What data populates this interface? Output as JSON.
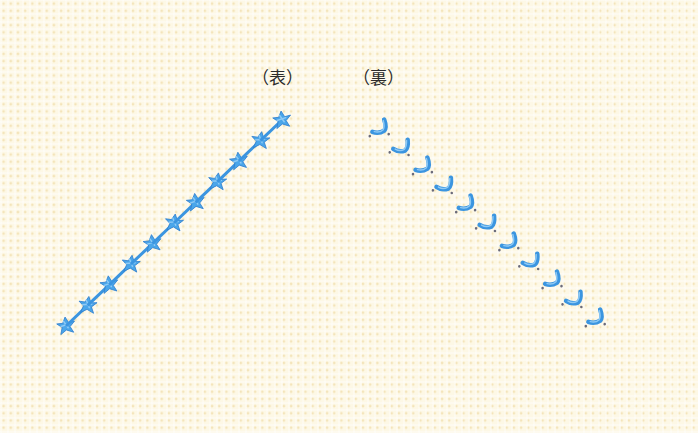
{
  "labels": {
    "front": "（表）",
    "back": "（裏）"
  },
  "colors": {
    "fabric": "#fdf8e6",
    "fabric_dots": "#ecd496",
    "thread": "#4aa6ea",
    "thread_dark": "#2f7fcf",
    "thread_light": "#8fcaf5",
    "text": "#2c2c2c"
  },
  "stitch_rows": [
    {
      "side": "front",
      "shape": "star-cross",
      "count": 11,
      "start": [
        66,
        326
      ],
      "end": [
        282,
        120
      ]
    },
    {
      "side": "back",
      "shape": "L-hook",
      "count": 11,
      "start": [
        380,
        128
      ],
      "end": [
        596,
        318
      ]
    }
  ]
}
